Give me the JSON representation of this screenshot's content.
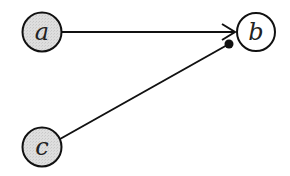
{
  "diagram": {
    "type": "directed-graph",
    "nodes": [
      {
        "id": "a",
        "label": "a",
        "shaded": true
      },
      {
        "id": "b",
        "label": "b",
        "shaded": false
      },
      {
        "id": "c",
        "label": "c",
        "shaded": true
      }
    ],
    "edges": [
      {
        "from": "a",
        "to": "b",
        "head": "arrow"
      },
      {
        "from": "c",
        "to": "b",
        "head": "dot"
      }
    ],
    "colors": {
      "shaded_fill": "#dcdcdc",
      "unshaded_fill": "#ffffff",
      "stroke": "#111111"
    }
  }
}
